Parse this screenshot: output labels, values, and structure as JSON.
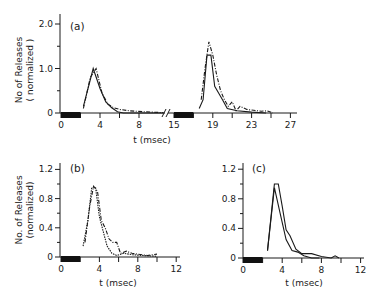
{
  "chart_data": [
    {
      "type": "line",
      "panel": "(a)",
      "xlabel": "t (msec)",
      "ylabel": "No of Releases",
      "ylabel_sub": "( normalized )",
      "yticks": [
        0,
        1.0,
        2.0
      ],
      "ytick_labels": [
        "0",
        "1.0",
        "2.0"
      ],
      "ylim": [
        0,
        2.2
      ],
      "axis_break": true,
      "segments": [
        {
          "xlim": [
            0,
            11
          ],
          "xticks": [
            0,
            4,
            8
          ],
          "xtick_labels": [
            "0",
            "4",
            "8"
          ],
          "stimulus_bar": [
            0,
            2
          ],
          "series": [
            {
              "name": "solid",
              "style": "solid",
              "x": [
                2.3,
                3.3,
                4.0,
                4.6,
                5.2,
                5.8,
                6.4,
                8,
                10.5
              ],
              "y": [
                0.15,
                1.0,
                0.55,
                0.25,
                0.12,
                0.03,
                0.0,
                0.0,
                0.0
              ]
            },
            {
              "name": "dash-dot",
              "style": "dashdot",
              "x": [
                2.3,
                3.0,
                3.6,
                4.2,
                4.8,
                5.4,
                6.0,
                7.0,
                8.5,
                10.5
              ],
              "y": [
                0.1,
                0.8,
                1.0,
                0.45,
                0.2,
                0.12,
                0.08,
                0.05,
                0.03,
                0.01
              ]
            }
          ]
        },
        {
          "xlim": [
            15,
            27
          ],
          "xticks": [
            15,
            19,
            23,
            27
          ],
          "xtick_labels": [
            "15",
            "19",
            "23",
            "27"
          ],
          "stimulus_bar": [
            15,
            17
          ],
          "series": [
            {
              "name": "solid",
              "style": "solid",
              "x": [
                17.6,
                18.0,
                18.4,
                18.8,
                19.2,
                19.6,
                20.0,
                20.5,
                21.5,
                23,
                24.5
              ],
              "y": [
                0.1,
                0.3,
                1.3,
                1.3,
                0.6,
                0.45,
                0.3,
                0.1,
                0.05,
                0.02,
                0.0
              ]
            },
            {
              "name": "dash-dot",
              "style": "dashdot",
              "x": [
                17.8,
                18.2,
                18.6,
                19.0,
                19.4,
                19.8,
                20.2,
                20.6,
                21.0,
                21.4,
                21.8,
                22.5,
                23.2,
                24,
                24.6,
                25.2
              ],
              "y": [
                0.3,
                1.0,
                1.6,
                1.3,
                0.85,
                0.5,
                0.3,
                0.15,
                0.25,
                0.05,
                0.15,
                0.08,
                0.06,
                0.04,
                0.05,
                0.0
              ]
            }
          ]
        }
      ]
    },
    {
      "type": "line",
      "panel": "(b)",
      "xlabel": "t (msec)",
      "ylabel": "No. of Releases",
      "ylabel_sub": "(normalized)",
      "xlim": [
        0,
        12
      ],
      "ylim": [
        0,
        1.3
      ],
      "xticks": [
        0,
        4,
        8,
        12
      ],
      "xtick_labels": [
        "0",
        "4",
        "8",
        "12"
      ],
      "yticks": [
        0,
        0.4,
        0.8,
        1.2
      ],
      "ytick_labels": [
        "0",
        "0.4",
        "0.8",
        "1.2"
      ],
      "stimulus_bar": [
        0,
        2
      ],
      "series": [
        {
          "name": "dotted-solid",
          "style": "dotted",
          "x": [
            2.3,
            2.8,
            3.2,
            3.6,
            4.0,
            4.4,
            4.8,
            5.3,
            5.8,
            6.5,
            7.5,
            8.5,
            10
          ],
          "y": [
            0.15,
            0.5,
            0.95,
            0.95,
            0.55,
            0.35,
            0.15,
            0.05,
            0.02,
            0.05,
            0.03,
            0.02,
            0.01
          ]
        },
        {
          "name": "dash-dot",
          "style": "dashdot",
          "x": [
            2.5,
            3.0,
            3.4,
            3.8,
            4.2,
            4.6,
            5.0,
            5.4,
            5.8,
            6.2,
            6.8,
            7.4,
            8,
            9,
            10
          ],
          "y": [
            0.2,
            0.7,
            0.97,
            0.9,
            0.5,
            0.4,
            0.25,
            0.2,
            0.2,
            0.05,
            0.08,
            0.05,
            0.04,
            0.02,
            0.04
          ]
        }
      ]
    },
    {
      "type": "line",
      "panel": "(c)",
      "xlabel": "t (msec)",
      "xlim": [
        0,
        12
      ],
      "ylim": [
        0,
        1.3
      ],
      "xticks": [
        0,
        4,
        8,
        12
      ],
      "xtick_labels": [
        "0",
        "4",
        "8",
        "12"
      ],
      "yticks": [
        0,
        0.4,
        0.8,
        1.2
      ],
      "ytick_labels": [
        "0",
        "0.4",
        "0.8",
        "1.2"
      ],
      "stimulus_bar": [
        0,
        2
      ],
      "series": [
        {
          "name": "solid-1",
          "style": "solid",
          "x": [
            2.5,
            3.2,
            3.6,
            4.0,
            4.4,
            4.8,
            5.4,
            6.0,
            7.0,
            8.0,
            9.0,
            9.4,
            9.8
          ],
          "y": [
            0.1,
            1.0,
            1.0,
            0.7,
            0.38,
            0.3,
            0.12,
            0.06,
            0.06,
            0.02,
            0.0,
            0.03,
            0.0
          ]
        },
        {
          "name": "solid-2",
          "style": "solid",
          "x": [
            2.5,
            3.2,
            3.8,
            4.4,
            5.0,
            5.6,
            6.2,
            7.0,
            7.8
          ],
          "y": [
            0.1,
            0.95,
            0.6,
            0.25,
            0.1,
            0.08,
            0.03,
            0.0,
            0.0
          ]
        }
      ]
    }
  ]
}
